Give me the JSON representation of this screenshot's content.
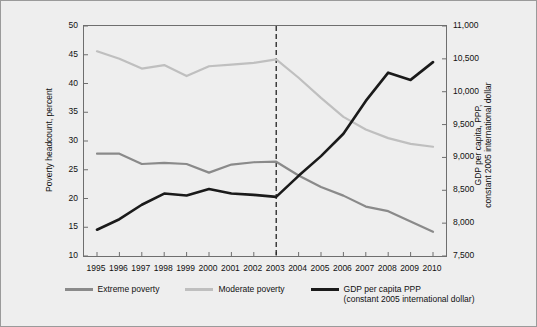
{
  "chart_data": {
    "type": "line",
    "title": "",
    "xlabel": "",
    "x": [
      1995,
      1996,
      1997,
      1998,
      1999,
      2000,
      2001,
      2002,
      2003,
      2004,
      2005,
      2006,
      2007,
      2008,
      2009,
      2010
    ],
    "xticklabels": [
      "1995",
      "1996",
      "1997",
      "1998",
      "1999",
      "2000",
      "2001",
      "2002",
      "2003",
      "2004",
      "2005",
      "2006",
      "2007",
      "2008",
      "2009",
      "2010"
    ],
    "left_axis": {
      "label": "Poverty headcount, percent",
      "ylim": [
        10,
        50
      ],
      "ticks": [
        10,
        15,
        20,
        25,
        30,
        35,
        40,
        45,
        50
      ],
      "ticklabels": [
        "10",
        "15",
        "20",
        "25",
        "30",
        "35",
        "40",
        "45",
        "50"
      ]
    },
    "right_axis": {
      "label": "GDP per capita, PPP,\nconstant 2005 international dollar",
      "ylim": [
        7500,
        11000
      ],
      "ticks": [
        7500,
        8000,
        8500,
        9000,
        9500,
        10000,
        10500,
        11000
      ],
      "ticklabels": [
        "7,500",
        "8,000",
        "8,500",
        "9,000",
        "9,500",
        "10,000",
        "10,500",
        "11,000"
      ]
    },
    "series": [
      {
        "name": "Extreme poverty",
        "axis": "left",
        "color": "#8a8a8a",
        "width": 2.2,
        "values": [
          27.8,
          27.8,
          26.0,
          26.2,
          26.0,
          24.5,
          25.9,
          26.3,
          26.4,
          24.0,
          22.0,
          20.5,
          18.6,
          17.8,
          16.0,
          14.2
        ]
      },
      {
        "name": "Moderate poverty",
        "axis": "left",
        "color": "#bfbfbf",
        "width": 2.2,
        "values": [
          45.6,
          44.3,
          42.6,
          43.2,
          41.3,
          43.0,
          43.3,
          43.6,
          44.2,
          41.0,
          37.5,
          34.2,
          32.0,
          30.5,
          29.5,
          29.0
        ]
      },
      {
        "name": "GDP per capita PPP\n(constant 2005 international dollar)",
        "axis": "right",
        "color": "#1a1a1a",
        "width": 2.6,
        "values": [
          7900,
          8060,
          8280,
          8450,
          8420,
          8520,
          8450,
          8430,
          8400,
          8720,
          9020,
          9360,
          9860,
          10290,
          10180,
          10450
        ]
      }
    ],
    "annotations": [
      {
        "type": "vline",
        "x": 2003,
        "style": "dashed",
        "color": "#111111"
      }
    ],
    "legend": {
      "position": "bottom",
      "entries": [
        {
          "label": "Extreme poverty",
          "color": "#8a8a8a"
        },
        {
          "label": "Moderate poverty",
          "color": "#bfbfbf"
        },
        {
          "label": "GDP per capita PPP\n(constant 2005 international dollar)",
          "color": "#1a1a1a"
        }
      ]
    },
    "grid": false,
    "background": "#eeeeee"
  }
}
